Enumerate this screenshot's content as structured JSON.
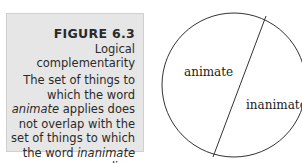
{
  "figure": {
    "number": "FIGURE 6.3",
    "title": "Logical complementarity",
    "caption": {
      "part1": "The set of things to which the word ",
      "term1": "animate",
      "part2": " applies does not overlap with the set of things to which the word ",
      "term2": "inanimate",
      "part3": " applies."
    }
  },
  "diagram": {
    "type": "set-partition-circle",
    "regions": [
      {
        "label": "animate"
      },
      {
        "label": "inanimate"
      }
    ]
  }
}
